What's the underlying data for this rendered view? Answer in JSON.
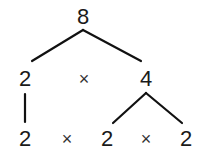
{
  "diagram": {
    "type": "factor-tree",
    "root": "8",
    "level1": {
      "left": "2",
      "operator": "×",
      "right": "4"
    },
    "level2": {
      "items": [
        "2",
        "×",
        "2",
        "×",
        "2"
      ]
    },
    "colors": {
      "text": "#1a1a1a",
      "lines": "#111111",
      "background": "#ffffff"
    }
  }
}
